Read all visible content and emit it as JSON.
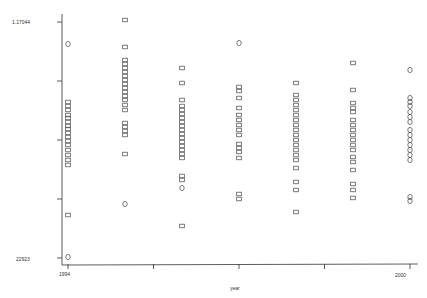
{
  "chart_data": {
    "type": "scatter",
    "title": "",
    "xlabel": "year",
    "ylabel": "",
    "xlim": [
      1994,
      2000
    ],
    "ylim_labels": [
      "22923",
      "1.17044"
    ],
    "ylim": [
      22923,
      117044
    ],
    "grid": false,
    "legend": null,
    "x_ticks": [
      1994,
      1995.5,
      1997,
      1998.5,
      2000
    ],
    "x_tick_labels": [
      "1994",
      "",
      "",
      "",
      "2000"
    ],
    "y_ticks": [
      117044,
      93514,
      69984,
      46453,
      22923
    ],
    "y_tick_labels": [
      "1.17044",
      "",
      "",
      "",
      "22923"
    ],
    "colors": {
      "axis": "#333333",
      "marker": "#444444",
      "background": "#ffffff"
    },
    "series": [
      {
        "name": "observations",
        "points": [
          {
            "x": 1994,
            "y": 108270,
            "m": "o"
          },
          {
            "x": 1994,
            "y": 85140,
            "m": "s"
          },
          {
            "x": 1994,
            "y": 83540,
            "m": "s"
          },
          {
            "x": 1994,
            "y": 81950,
            "m": "s"
          },
          {
            "x": 1994,
            "y": 79950,
            "m": "s"
          },
          {
            "x": 1994,
            "y": 78760,
            "m": "s"
          },
          {
            "x": 1994,
            "y": 77160,
            "m": "s"
          },
          {
            "x": 1994,
            "y": 75570,
            "m": "s"
          },
          {
            "x": 1994,
            "y": 74370,
            "m": "s"
          },
          {
            "x": 1994,
            "y": 72780,
            "m": "s"
          },
          {
            "x": 1994,
            "y": 71180,
            "m": "s"
          },
          {
            "x": 1994,
            "y": 69590,
            "m": "s"
          },
          {
            "x": 1994,
            "y": 67990,
            "m": "s"
          },
          {
            "x": 1994,
            "y": 65990,
            "m": "s"
          },
          {
            "x": 1994,
            "y": 64000,
            "m": "s"
          },
          {
            "x": 1994,
            "y": 62010,
            "m": "s"
          },
          {
            "x": 1994,
            "y": 60020,
            "m": "s"
          },
          {
            "x": 1994,
            "y": 40070,
            "m": "s"
          },
          {
            "x": 1994,
            "y": 23320,
            "m": "o"
          },
          {
            "x": 1995,
            "y": 117840,
            "m": "s"
          },
          {
            "x": 1995,
            "y": 107070,
            "m": "s"
          },
          {
            "x": 1995,
            "y": 101890,
            "m": "s"
          },
          {
            "x": 1995,
            "y": 100300,
            "m": "s"
          },
          {
            "x": 1995,
            "y": 98700,
            "m": "s"
          },
          {
            "x": 1995,
            "y": 97110,
            "m": "s"
          },
          {
            "x": 1995,
            "y": 95510,
            "m": "s"
          },
          {
            "x": 1995,
            "y": 93920,
            "m": "s"
          },
          {
            "x": 1995,
            "y": 92320,
            "m": "s"
          },
          {
            "x": 1995,
            "y": 90730,
            "m": "s"
          },
          {
            "x": 1995,
            "y": 89130,
            "m": "s"
          },
          {
            "x": 1995,
            "y": 87540,
            "m": "s"
          },
          {
            "x": 1995,
            "y": 85940,
            "m": "s"
          },
          {
            "x": 1995,
            "y": 83940,
            "m": "s"
          },
          {
            "x": 1995,
            "y": 81950,
            "m": "s"
          },
          {
            "x": 1995,
            "y": 76770,
            "m": "s"
          },
          {
            "x": 1995,
            "y": 75170,
            "m": "s"
          },
          {
            "x": 1995,
            "y": 73580,
            "m": "s"
          },
          {
            "x": 1995,
            "y": 71980,
            "m": "s"
          },
          {
            "x": 1995,
            "y": 64400,
            "m": "s"
          },
          {
            "x": 1995,
            "y": 44460,
            "m": "o"
          },
          {
            "x": 1996,
            "y": 98700,
            "m": "s"
          },
          {
            "x": 1996,
            "y": 92720,
            "m": "s"
          },
          {
            "x": 1996,
            "y": 85940,
            "m": "s"
          },
          {
            "x": 1996,
            "y": 83540,
            "m": "s"
          },
          {
            "x": 1996,
            "y": 81950,
            "m": "s"
          },
          {
            "x": 1996,
            "y": 80350,
            "m": "s"
          },
          {
            "x": 1996,
            "y": 78760,
            "m": "s"
          },
          {
            "x": 1996,
            "y": 77160,
            "m": "s"
          },
          {
            "x": 1996,
            "y": 75570,
            "m": "s"
          },
          {
            "x": 1996,
            "y": 73980,
            "m": "s"
          },
          {
            "x": 1996,
            "y": 72380,
            "m": "s"
          },
          {
            "x": 1996,
            "y": 70790,
            "m": "s"
          },
          {
            "x": 1996,
            "y": 69190,
            "m": "s"
          },
          {
            "x": 1996,
            "y": 67590,
            "m": "s"
          },
          {
            "x": 1996,
            "y": 66000,
            "m": "s"
          },
          {
            "x": 1996,
            "y": 64400,
            "m": "s"
          },
          {
            "x": 1996,
            "y": 62810,
            "m": "s"
          },
          {
            "x": 1996,
            "y": 55630,
            "m": "s"
          },
          {
            "x": 1996,
            "y": 54040,
            "m": "s"
          },
          {
            "x": 1996,
            "y": 50850,
            "m": "o"
          },
          {
            "x": 1996,
            "y": 35690,
            "m": "s"
          },
          {
            "x": 1997,
            "y": 108670,
            "m": "o"
          },
          {
            "x": 1997,
            "y": 91130,
            "m": "s"
          },
          {
            "x": 1997,
            "y": 89530,
            "m": "s"
          },
          {
            "x": 1997,
            "y": 86740,
            "m": "s"
          },
          {
            "x": 1997,
            "y": 82750,
            "m": "s"
          },
          {
            "x": 1997,
            "y": 79950,
            "m": "s"
          },
          {
            "x": 1997,
            "y": 77960,
            "m": "s"
          },
          {
            "x": 1997,
            "y": 75970,
            "m": "s"
          },
          {
            "x": 1997,
            "y": 73980,
            "m": "s"
          },
          {
            "x": 1997,
            "y": 71980,
            "m": "s"
          },
          {
            "x": 1997,
            "y": 68390,
            "m": "s"
          },
          {
            "x": 1997,
            "y": 66800,
            "m": "s"
          },
          {
            "x": 1997,
            "y": 65200,
            "m": "s"
          },
          {
            "x": 1997,
            "y": 62810,
            "m": "s"
          },
          {
            "x": 1997,
            "y": 48450,
            "m": "s"
          },
          {
            "x": 1997,
            "y": 46450,
            "m": "s"
          },
          {
            "x": 1998,
            "y": 92720,
            "m": "s"
          },
          {
            "x": 1998,
            "y": 87930,
            "m": "s"
          },
          {
            "x": 1998,
            "y": 85940,
            "m": "s"
          },
          {
            "x": 1998,
            "y": 83940,
            "m": "s"
          },
          {
            "x": 1998,
            "y": 81950,
            "m": "s"
          },
          {
            "x": 1998,
            "y": 79950,
            "m": "s"
          },
          {
            "x": 1998,
            "y": 77960,
            "m": "s"
          },
          {
            "x": 1998,
            "y": 75970,
            "m": "s"
          },
          {
            "x": 1998,
            "y": 73980,
            "m": "s"
          },
          {
            "x": 1998,
            "y": 71980,
            "m": "s"
          },
          {
            "x": 1998,
            "y": 69990,
            "m": "s"
          },
          {
            "x": 1998,
            "y": 68000,
            "m": "s"
          },
          {
            "x": 1998,
            "y": 66000,
            "m": "s"
          },
          {
            "x": 1998,
            "y": 64000,
            "m": "s"
          },
          {
            "x": 1998,
            "y": 62010,
            "m": "s"
          },
          {
            "x": 1998,
            "y": 58820,
            "m": "s"
          },
          {
            "x": 1998,
            "y": 53240,
            "m": "s"
          },
          {
            "x": 1998,
            "y": 50050,
            "m": "s"
          },
          {
            "x": 1998,
            "y": 41270,
            "m": "s"
          },
          {
            "x": 1999,
            "y": 100700,
            "m": "s"
          },
          {
            "x": 1999,
            "y": 89930,
            "m": "s"
          },
          {
            "x": 1999,
            "y": 84740,
            "m": "s"
          },
          {
            "x": 1999,
            "y": 82750,
            "m": "s"
          },
          {
            "x": 1999,
            "y": 81150,
            "m": "s"
          },
          {
            "x": 1999,
            "y": 77960,
            "m": "s"
          },
          {
            "x": 1999,
            "y": 75970,
            "m": "s"
          },
          {
            "x": 1999,
            "y": 73980,
            "m": "s"
          },
          {
            "x": 1999,
            "y": 71980,
            "m": "s"
          },
          {
            "x": 1999,
            "y": 69990,
            "m": "s"
          },
          {
            "x": 1999,
            "y": 68000,
            "m": "s"
          },
          {
            "x": 1999,
            "y": 66000,
            "m": "s"
          },
          {
            "x": 1999,
            "y": 63210,
            "m": "s"
          },
          {
            "x": 1999,
            "y": 61210,
            "m": "s"
          },
          {
            "x": 1999,
            "y": 58020,
            "m": "s"
          },
          {
            "x": 1999,
            "y": 52440,
            "m": "s"
          },
          {
            "x": 1999,
            "y": 50050,
            "m": "s"
          },
          {
            "x": 1999,
            "y": 46860,
            "m": "s"
          },
          {
            "x": 2000,
            "y": 97900,
            "m": "o"
          },
          {
            "x": 2000,
            "y": 86740,
            "m": "o"
          },
          {
            "x": 2000,
            "y": 85140,
            "m": "o"
          },
          {
            "x": 2000,
            "y": 83540,
            "m": "o"
          },
          {
            "x": 2000,
            "y": 81150,
            "m": "o"
          },
          {
            "x": 2000,
            "y": 79160,
            "m": "o"
          },
          {
            "x": 2000,
            "y": 77160,
            "m": "o"
          },
          {
            "x": 2000,
            "y": 73980,
            "m": "o"
          },
          {
            "x": 2000,
            "y": 71980,
            "m": "o"
          },
          {
            "x": 2000,
            "y": 69990,
            "m": "o"
          },
          {
            "x": 2000,
            "y": 68000,
            "m": "o"
          },
          {
            "x": 2000,
            "y": 66000,
            "m": "o"
          },
          {
            "x": 2000,
            "y": 64000,
            "m": "o"
          },
          {
            "x": 2000,
            "y": 62010,
            "m": "o"
          },
          {
            "x": 2000,
            "y": 47250,
            "m": "o"
          },
          {
            "x": 2000,
            "y": 45660,
            "m": "o"
          }
        ]
      }
    ]
  }
}
